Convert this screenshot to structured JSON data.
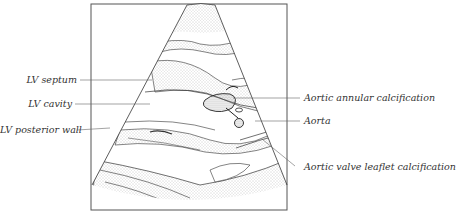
{
  "figure": {
    "labels_left": [
      {
        "id": "lv-septum",
        "text": "LV septum"
      },
      {
        "id": "lv-cavity",
        "text": "LV cavity"
      },
      {
        "id": "lv-posterior-wall",
        "text": "LV posterior wall"
      }
    ],
    "labels_right": [
      {
        "id": "aortic-annular-calcification",
        "text": "Aortic annular calcification"
      },
      {
        "id": "aorta",
        "text": "Aorta"
      },
      {
        "id": "aortic-valve-leaflet-calcification",
        "text": "Aortic valve leaflet calcification"
      }
    ]
  },
  "colors": {
    "line": "#333333",
    "stipple": "#9a9a9a",
    "frame": "#555555"
  }
}
